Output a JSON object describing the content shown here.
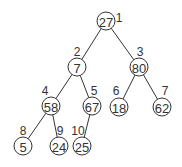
{
  "diagram": {
    "type": "binary-tree",
    "nodes": [
      {
        "index": "1",
        "value": "27",
        "cx": 106,
        "cy": 21,
        "lx": 119,
        "ly": 18
      },
      {
        "index": "2",
        "value": "7",
        "cx": 77,
        "cy": 67,
        "lx": 77,
        "ly": 52
      },
      {
        "index": "3",
        "value": "80",
        "cx": 139,
        "cy": 67,
        "lx": 140,
        "ly": 52
      },
      {
        "index": "4",
        "value": "58",
        "cx": 51,
        "cy": 106,
        "lx": 45,
        "ly": 91
      },
      {
        "index": "5",
        "value": "67",
        "cx": 92,
        "cy": 106,
        "lx": 94,
        "ly": 91
      },
      {
        "index": "6",
        "value": "18",
        "cx": 119,
        "cy": 107,
        "lx": 116,
        "ly": 91
      },
      {
        "index": "7",
        "value": "62",
        "cx": 162,
        "cy": 107,
        "lx": 165,
        "ly": 91
      },
      {
        "index": "8",
        "value": "5",
        "cx": 23,
        "cy": 146,
        "lx": 23,
        "ly": 131
      },
      {
        "index": "9",
        "value": "24",
        "cx": 59,
        "cy": 146,
        "lx": 60,
        "ly": 131
      },
      {
        "index": "10",
        "value": "25",
        "cx": 82,
        "cy": 146,
        "lx": 78,
        "ly": 131
      }
    ],
    "edges": [
      [
        0,
        1
      ],
      [
        0,
        2
      ],
      [
        1,
        3
      ],
      [
        1,
        4
      ],
      [
        2,
        5
      ],
      [
        2,
        6
      ],
      [
        3,
        7
      ],
      [
        3,
        8
      ],
      [
        4,
        9
      ]
    ],
    "radius": 9
  }
}
